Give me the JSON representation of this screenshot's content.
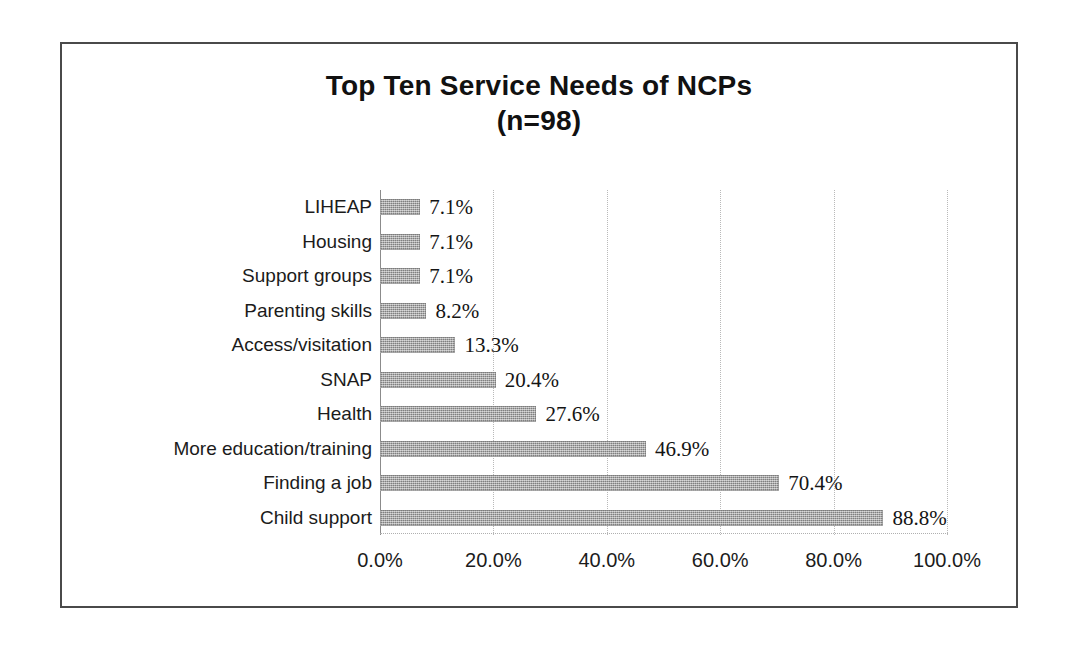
{
  "figure": {
    "title_line_1": "Top Ten Service Needs of NCPs",
    "title_line_2": "(n=98)",
    "frame_color": "#4a4a4a",
    "background_color": "#ffffff"
  },
  "chart_data": {
    "type": "bar",
    "orientation": "horizontal",
    "title": "Top Ten Service Needs of NCPs (n=98)",
    "subtitle": "(n=98)",
    "sample_size": 98,
    "xlabel": "",
    "ylabel": "",
    "xlim": [
      0,
      100
    ],
    "x_tick_values": [
      0,
      20,
      40,
      60,
      80,
      100
    ],
    "x_tick_labels": [
      "0.0%",
      "20.0%",
      "40.0%",
      "60.0%",
      "80.0%",
      "100.0%"
    ],
    "grid": "vertical-dotted",
    "legend": "none",
    "bar_color": "#9a9a9a",
    "value_label_format": "percent-one-decimal",
    "categories": [
      "LIHEAP",
      "Housing",
      "Support groups",
      "Parenting skills",
      "Access/visitation",
      "SNAP",
      "Health",
      "More education/training",
      "Finding a job",
      "Child support"
    ],
    "values": [
      7.1,
      7.1,
      7.1,
      8.2,
      13.3,
      20.4,
      27.6,
      46.9,
      70.4,
      88.8
    ],
    "value_labels": [
      "7.1%",
      "7.1%",
      "7.1%",
      "8.2%",
      "13.3%",
      "20.4%",
      "27.6%",
      "46.9%",
      "70.4%",
      "88.8%"
    ],
    "bars": [
      {
        "category": "LIHEAP",
        "value": 7.1,
        "label": "7.1%"
      },
      {
        "category": "Housing",
        "value": 7.1,
        "label": "7.1%"
      },
      {
        "category": "Support groups",
        "value": 7.1,
        "label": "7.1%"
      },
      {
        "category": "Parenting skills",
        "value": 8.2,
        "label": "8.2%"
      },
      {
        "category": "Access/visitation",
        "value": 13.3,
        "label": "13.3%"
      },
      {
        "category": "SNAP",
        "value": 20.4,
        "label": "20.4%"
      },
      {
        "category": "Health",
        "value": 27.6,
        "label": "27.6%"
      },
      {
        "category": "More education/training",
        "value": 46.9,
        "label": "46.9%"
      },
      {
        "category": "Finding a job",
        "value": 70.4,
        "label": "70.4%"
      },
      {
        "category": "Child support",
        "value": 88.8,
        "label": "88.8%"
      }
    ]
  }
}
